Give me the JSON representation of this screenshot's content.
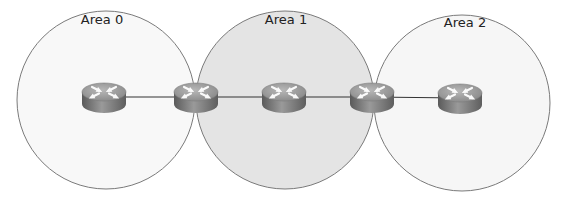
{
  "diagram": {
    "type": "network-topology",
    "areas": [
      {
        "label": "Area 0",
        "cx": 106,
        "cy": 100,
        "r": 89,
        "fill": "#f7f7f7",
        "label_x": 102,
        "label_y": 12
      },
      {
        "label": "Area 1",
        "cx": 285,
        "cy": 100,
        "r": 89,
        "fill": "#e2e2e2",
        "label_x": 286,
        "label_y": 12
      },
      {
        "label": "Area 2",
        "cx": 462,
        "cy": 103,
        "r": 88,
        "fill": "#f5f5f5",
        "label_x": 465,
        "label_y": 15
      }
    ],
    "routers": [
      {
        "id": "R1",
        "x": 104,
        "y": 99,
        "area": "Area 0"
      },
      {
        "id": "R2",
        "x": 196,
        "y": 99,
        "area": "Area 0 / Area 1"
      },
      {
        "id": "R3",
        "x": 284,
        "y": 99,
        "area": "Area 1"
      },
      {
        "id": "R4",
        "x": 372,
        "y": 99,
        "area": "Area 1 / Area 2"
      },
      {
        "id": "R5",
        "x": 460,
        "y": 100,
        "area": "Area 2"
      }
    ],
    "links": [
      [
        "R1",
        "R2"
      ],
      [
        "R2",
        "R3"
      ],
      [
        "R3",
        "R4"
      ],
      [
        "R4",
        "R5"
      ]
    ],
    "colors": {
      "circle_stroke": "#7a7a7a",
      "link": "#333333",
      "router_top": "#9a9a9a",
      "router_side": "#6e6e6e",
      "arrows": "#ffffff"
    }
  }
}
